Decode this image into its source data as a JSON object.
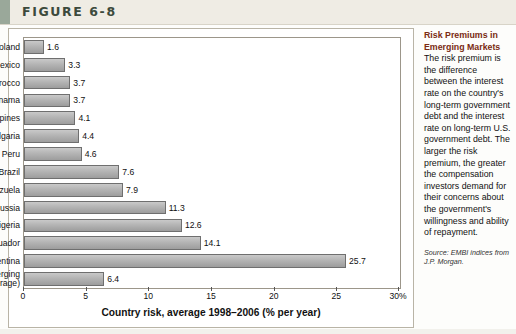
{
  "figure": {
    "label": "FIGURE 6-8"
  },
  "chart_data": {
    "type": "bar",
    "orientation": "horizontal",
    "title": "",
    "xlabel": "Country risk, average 1998–2006 (% per year)",
    "ylabel": "",
    "xlim": [
      0,
      30
    ],
    "xticks": [
      0,
      5,
      10,
      15,
      20,
      25,
      30
    ],
    "xticklabels": [
      "0",
      "5",
      "10",
      "15",
      "20",
      "25",
      "30%"
    ],
    "grid": false,
    "legend": null,
    "categories": [
      "Poland",
      "Mexico",
      "Morocco",
      "Panama",
      "Philippines",
      "Bulgaria",
      "Peru",
      "Brazil",
      "Venezuela",
      "Russia",
      "Nigeria",
      "Ecuador",
      "Argentina",
      "All emerging markets (average)"
    ],
    "category_lines": [
      [
        "Poland"
      ],
      [
        "Mexico"
      ],
      [
        "Morocco"
      ],
      [
        "Panama"
      ],
      [
        "Philippines"
      ],
      [
        "Bulgaria"
      ],
      [
        "Peru"
      ],
      [
        "Brazil"
      ],
      [
        "Venezuela"
      ],
      [
        "Russia"
      ],
      [
        "Nigeria"
      ],
      [
        "Ecuador"
      ],
      [
        "Argentina"
      ],
      [
        "All emerging",
        "markets (average)"
      ]
    ],
    "values": [
      1.6,
      3.3,
      3.7,
      3.7,
      4.1,
      4.4,
      4.6,
      7.6,
      7.9,
      11.3,
      12.6,
      14.1,
      25.7,
      6.4
    ],
    "value_labels": [
      "1.6",
      "3.3",
      "3.7",
      "3.7",
      "4.1",
      "4.4",
      "4.6",
      "7.6",
      "7.9",
      "11.3",
      "12.6",
      "14.1",
      "25.7",
      "6.4"
    ],
    "bar_color": "#b4b4b4",
    "bar_edge_color": "#6f6f6f"
  },
  "sidebar": {
    "title": "Risk Premiums in Emerging Markets",
    "body": "The risk premium is the difference between the interest rate on the country's long-term government debt and the interest rate on long-term U.S. government debt. The larger the risk premium, the greater the compensation investors demand for their concerns about the government's willingness and ability of repayment.",
    "source": "Source: EMBI indices from J.P. Morgan."
  }
}
